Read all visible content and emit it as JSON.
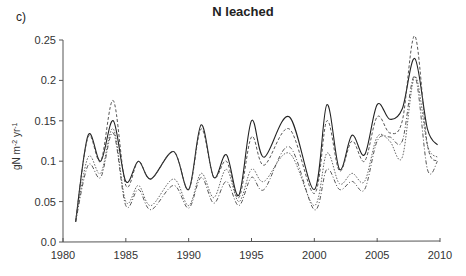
{
  "panel_label": "c)",
  "chart_data": {
    "type": "line",
    "title": "N leached",
    "xlabel": "",
    "ylabel": "gN m-2 yr-1",
    "xlim": [
      1980,
      2010
    ],
    "ylim": [
      0.0,
      0.25
    ],
    "xticks": [
      1980,
      1985,
      1990,
      1995,
      2000,
      2005,
      2010
    ],
    "xtick_labels": [
      "1980",
      "1985",
      "1990",
      "1995",
      "2000",
      "2005",
      "2010"
    ],
    "yticks": [
      0.0,
      0.05,
      0.1,
      0.15,
      0.2,
      0.25
    ],
    "ytick_labels": [
      "0.0",
      "0.05",
      "0.1",
      "0.15",
      "0.2",
      "0.25"
    ],
    "grid": false,
    "legend": null,
    "x": [
      1981,
      1982,
      1983,
      1984,
      1985,
      1986,
      1987,
      1988.8,
      1990,
      1991,
      1992,
      1993,
      1994,
      1995,
      1996,
      1998,
      2000,
      2001,
      2002,
      2003,
      2004,
      2005,
      2006,
      2007,
      2008,
      2009,
      2009.8
    ],
    "series": [
      {
        "name": "solid",
        "style": "solid",
        "values": [
          0.025,
          0.132,
          0.1,
          0.15,
          0.075,
          0.1,
          0.078,
          0.112,
          0.065,
          0.145,
          0.08,
          0.108,
          0.058,
          0.15,
          0.105,
          0.155,
          0.065,
          0.17,
          0.09,
          0.132,
          0.108,
          0.17,
          0.152,
          0.165,
          0.227,
          0.14,
          0.12
        ]
      },
      {
        "name": "dashed",
        "style": "dashed",
        "values": [
          0.025,
          0.13,
          0.1,
          0.175,
          0.07,
          0.1,
          0.078,
          0.112,
          0.065,
          0.14,
          0.08,
          0.1,
          0.055,
          0.13,
          0.095,
          0.14,
          0.06,
          0.15,
          0.088,
          0.125,
          0.1,
          0.155,
          0.135,
          0.15,
          0.255,
          0.12,
          0.1
        ]
      },
      {
        "name": "dotted",
        "style": "dotted",
        "values": [
          0.025,
          0.105,
          0.085,
          0.14,
          0.05,
          0.07,
          0.045,
          0.078,
          0.045,
          0.085,
          0.055,
          0.09,
          0.05,
          0.09,
          0.075,
          0.11,
          0.045,
          0.11,
          0.072,
          0.085,
          0.075,
          0.13,
          0.125,
          0.105,
          0.205,
          0.12,
          0.105
        ]
      },
      {
        "name": "dash-dot",
        "style": "dashdot",
        "values": [
          0.025,
          0.095,
          0.08,
          0.135,
          0.045,
          0.065,
          0.04,
          0.07,
          0.042,
          0.08,
          0.048,
          0.075,
          0.045,
          0.08,
          0.065,
          0.118,
          0.04,
          0.09,
          0.065,
          0.075,
          0.065,
          0.125,
          0.13,
          0.125,
          0.205,
          0.09,
          0.1
        ]
      }
    ]
  }
}
